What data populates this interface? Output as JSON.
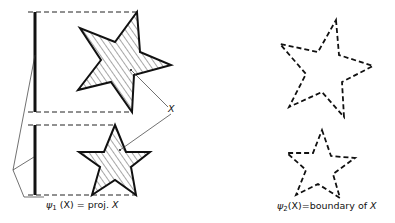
{
  "figure": {
    "left_panel": {
      "label_prefix": "ψ",
      "label_subscript": "1",
      "label_arg": "(X)",
      "label_rest": " = proj. ",
      "label_var": "X",
      "point_marker": "X"
    },
    "right_panel": {
      "label_prefix": "ψ",
      "label_subscript": "2",
      "label_arg": "(X)",
      "label_rest": "=boundary of ",
      "label_var": "X"
    },
    "colors": {
      "ink": "#111111",
      "background": "#ffffff"
    }
  }
}
